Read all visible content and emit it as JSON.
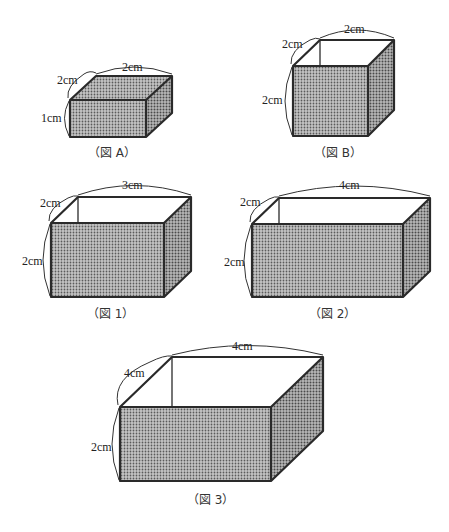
{
  "figures": [
    {
      "id": "A",
      "caption": "（図 A）",
      "type": "closed-box",
      "labels": {
        "width": "2cm",
        "depth": "2cm",
        "height": "1cm"
      }
    },
    {
      "id": "B",
      "caption": "（図 B）",
      "type": "open-box",
      "labels": {
        "width": "2cm",
        "depth": "2cm",
        "height": "2cm"
      }
    },
    {
      "id": "1",
      "caption": "（図 1）",
      "type": "open-box",
      "labels": {
        "width": "3cm",
        "depth": "2cm",
        "height": "2cm"
      }
    },
    {
      "id": "2",
      "caption": "（図 2）",
      "type": "open-box",
      "labels": {
        "width": "4cm",
        "depth": "2cm",
        "height": "2cm"
      }
    },
    {
      "id": "3",
      "caption": "（図 3）",
      "type": "open-box",
      "labels": {
        "width": "4cm",
        "depth": "4cm",
        "height": "2cm"
      }
    }
  ],
  "colors": {
    "shade": "#a9a9a9",
    "shade_side": "#9c9c9c",
    "edge": "#2a2a2a"
  }
}
